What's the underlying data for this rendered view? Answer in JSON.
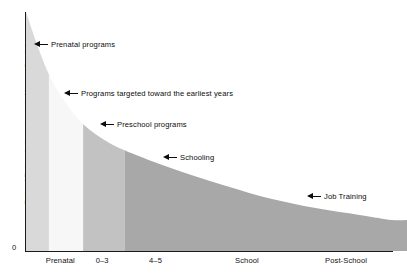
{
  "chart_data": {
    "type": "area",
    "title": "",
    "xlabel": "",
    "ylabel": "Rate of Return to Investment in Human Capital",
    "y_origin_tick": "0",
    "grid": false,
    "legend": "none",
    "categories": [
      "Prenatal",
      "0–3",
      "4–5",
      "School",
      "Post-School"
    ],
    "category_bands": [
      {
        "label": "Prenatal",
        "x_start": 0,
        "x_end": 6,
        "fill": "#d9d9d9",
        "label_center": 9
      },
      {
        "label": "0–3",
        "x_start": 6,
        "x_end": 15,
        "fill": "#f7f7f7",
        "label_center": 20
      },
      {
        "label": "4–5",
        "x_start": 15,
        "x_end": 26,
        "fill": "#c2c2c2",
        "label_center": 34
      },
      {
        "label": "School",
        "x_start": 26,
        "x_end": 53,
        "fill": "#a8a8a8",
        "label_center": 58
      },
      {
        "label": "Post-School",
        "x_start": 53,
        "x_end": 100,
        "fill": "#a8a8a8",
        "label_center": 84
      }
    ],
    "curve_points": [
      {
        "x": 0,
        "y": 100
      },
      {
        "x": 3,
        "y": 86
      },
      {
        "x": 6,
        "y": 74
      },
      {
        "x": 10,
        "y": 63
      },
      {
        "x": 15,
        "y": 53
      },
      {
        "x": 21,
        "y": 46
      },
      {
        "x": 26,
        "y": 42
      },
      {
        "x": 34,
        "y": 37
      },
      {
        "x": 43,
        "y": 32
      },
      {
        "x": 53,
        "y": 27
      },
      {
        "x": 64,
        "y": 22
      },
      {
        "x": 76,
        "y": 18
      },
      {
        "x": 88,
        "y": 15
      },
      {
        "x": 96,
        "y": 13
      },
      {
        "x": 100,
        "y": 13
      }
    ],
    "annotations": [
      {
        "text": "Prenatal programs",
        "x_px": 34,
        "y_px": 40
      },
      {
        "text": "Programs targeted toward the earliest years",
        "x_px": 64,
        "y_px": 89
      },
      {
        "text": "Preschool programs",
        "x_px": 100,
        "y_px": 120
      },
      {
        "text": "Schooling",
        "x_px": 163,
        "y_px": 153
      },
      {
        "text": "Job Training",
        "x_px": 307,
        "y_px": 192
      }
    ],
    "colors": {
      "band_prenatal": "#d9d9d9",
      "band_0_3": "#f7f7f7",
      "band_4_5": "#c2c2c2",
      "band_school": "#a8a8a8",
      "band_post_school": "#a8a8a8",
      "axis": "#1a1a1a",
      "text": "#111111",
      "background": "#ffffff"
    }
  }
}
